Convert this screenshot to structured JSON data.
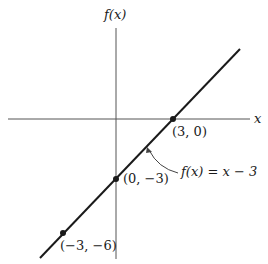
{
  "axes": {
    "y_label": "f(x)",
    "x_label": "x"
  },
  "function_label": "f(x) = x − 3",
  "points": [
    {
      "label": "(3, 0)",
      "x": 3,
      "y": 0
    },
    {
      "label": "(0, −3)",
      "x": 0,
      "y": -3
    },
    {
      "label": "(−3, −6)",
      "x": -3,
      "y": -6
    }
  ],
  "colors": {
    "ink": "#1a1a1a",
    "axis": "#555555"
  }
}
